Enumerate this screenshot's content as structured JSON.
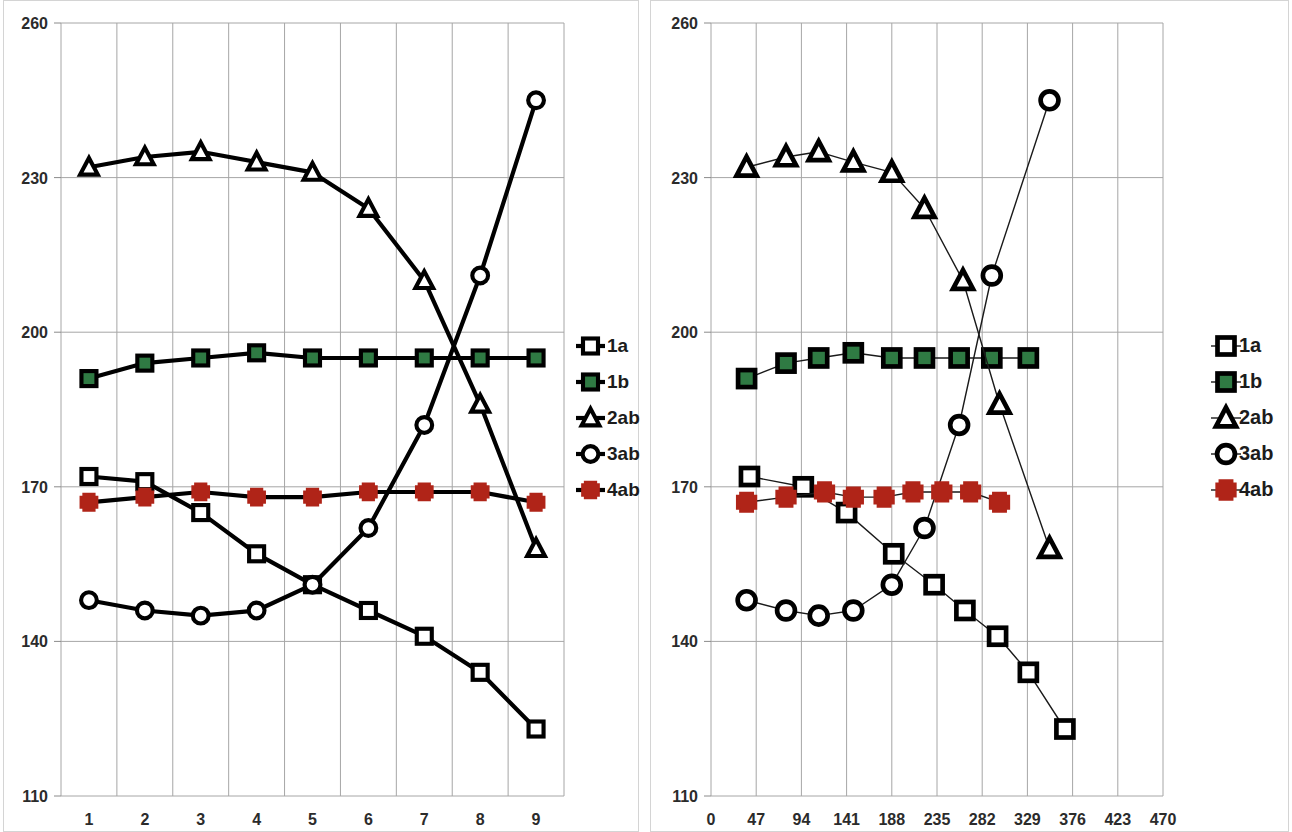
{
  "chart_data": [
    {
      "panel": "left",
      "type": "line",
      "title": "",
      "xlabel": "",
      "ylabel": "",
      "axis_type": "category",
      "categories": [
        "1",
        "2",
        "3",
        "4",
        "5",
        "6",
        "7",
        "8",
        "9"
      ],
      "xticks": [
        "1",
        "2",
        "3",
        "4",
        "5",
        "6",
        "7",
        "8",
        "9"
      ],
      "yticks": [
        "110",
        "140",
        "170",
        "200",
        "230",
        "260"
      ],
      "ylim": [
        110,
        260
      ],
      "grid": true,
      "legend_position": "right",
      "line_style": "thick",
      "series": [
        {
          "name": "1a",
          "marker": "square-open",
          "color": "#000000",
          "values": [
            172,
            171,
            165,
            157,
            151,
            146,
            141,
            134,
            123
          ]
        },
        {
          "name": "1b",
          "marker": "square-filled",
          "color": "#2f7a43",
          "values": [
            191,
            194,
            195,
            196,
            195,
            195,
            195,
            195,
            195
          ]
        },
        {
          "name": "2ab",
          "marker": "triangle-open",
          "color": "#000000",
          "values": [
            232,
            234,
            235,
            233,
            231,
            224,
            210,
            186,
            158
          ]
        },
        {
          "name": "3ab",
          "marker": "circle-open",
          "color": "#000000",
          "values": [
            148,
            146,
            145,
            146,
            151,
            162,
            182,
            211,
            245
          ]
        },
        {
          "name": "4ab",
          "marker": "plus",
          "color": "#b02418",
          "values": [
            167,
            168,
            169,
            168,
            168,
            169,
            169,
            169,
            167
          ]
        }
      ],
      "legend": [
        {
          "label": "1a",
          "marker": "square-open",
          "color": "#000000"
        },
        {
          "label": "1b",
          "marker": "square-filled",
          "color": "#2f7a43"
        },
        {
          "label": "2ab",
          "marker": "triangle-open",
          "color": "#000000"
        },
        {
          "label": "3ab",
          "marker": "circle-open",
          "color": "#000000"
        },
        {
          "label": "4ab",
          "marker": "plus",
          "color": "#b02418"
        }
      ]
    },
    {
      "panel": "right",
      "type": "line",
      "title": "",
      "xlabel": "",
      "ylabel": "",
      "axis_type": "numeric",
      "xticks": [
        "0",
        "47",
        "94",
        "141",
        "188",
        "235",
        "282",
        "329",
        "376",
        "423",
        "470"
      ],
      "yticks": [
        "110",
        "140",
        "170",
        "200",
        "230",
        "260"
      ],
      "xlim": [
        0,
        470
      ],
      "ylim": [
        110,
        260
      ],
      "grid": true,
      "legend_position": "right",
      "line_style": "thin",
      "x": [
        37,
        78,
        112,
        148,
        188,
        222,
        258,
        292,
        330,
        368,
        408
      ],
      "series": [
        {
          "name": "1a",
          "marker": "square-open",
          "color": "#000000",
          "x": [
            40,
            96,
            141,
            190,
            232,
            264,
            298,
            330,
            368,
            408
          ],
          "values": [
            172,
            170,
            165,
            157,
            151,
            146,
            141,
            134,
            123,
            null
          ]
        },
        {
          "name": "1b",
          "marker": "square-filled",
          "color": "#2f7a43",
          "x": [
            37,
            78,
            112,
            148,
            188,
            222,
            258,
            292,
            330
          ],
          "values": [
            191,
            194,
            195,
            196,
            195,
            195,
            195,
            195,
            195
          ]
        },
        {
          "name": "2ab",
          "marker": "triangle-open",
          "color": "#000000",
          "x": [
            37,
            78,
            112,
            148,
            188,
            222,
            262,
            300,
            352
          ],
          "values": [
            232,
            234,
            235,
            233,
            231,
            224,
            210,
            186,
            158
          ]
        },
        {
          "name": "3ab",
          "marker": "circle-open",
          "color": "#000000",
          "x": [
            37,
            78,
            112,
            148,
            188,
            222,
            258,
            292,
            352
          ],
          "values": [
            148,
            146,
            145,
            146,
            151,
            162,
            182,
            211,
            245
          ]
        },
        {
          "name": "4ab",
          "marker": "plus",
          "color": "#b02418",
          "x": [
            37,
            78,
            118,
            148,
            180,
            210,
            240,
            270,
            300
          ],
          "values": [
            167,
            168,
            169,
            168,
            168,
            169,
            169,
            169,
            167
          ]
        }
      ],
      "legend": [
        {
          "label": "1a",
          "marker": "square-open",
          "color": "#000000"
        },
        {
          "label": "1b",
          "marker": "square-filled",
          "color": "#2f7a43"
        },
        {
          "label": "2ab",
          "marker": "triangle-open",
          "color": "#000000"
        },
        {
          "label": "3ab",
          "marker": "circle-open",
          "color": "#000000"
        },
        {
          "label": "4ab",
          "marker": "plus",
          "color": "#b02418"
        }
      ]
    }
  ],
  "colors": {
    "series_green": "#2f7a43",
    "series_red": "#b02418",
    "series_black": "#000000",
    "gridline": "#a6a6a6",
    "panel_border": "#d4d4d4",
    "tick_label": "#2b2b2b"
  }
}
